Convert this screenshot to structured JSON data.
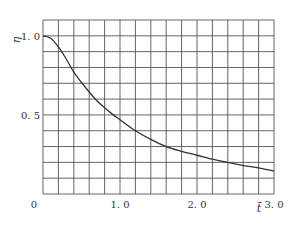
{
  "chart_data": {
    "type": "line",
    "title": "",
    "xlabel": "t̄",
    "ylabel": "η",
    "xlim": [
      0,
      3.0
    ],
    "ylim": [
      0,
      1.1
    ],
    "grid": true,
    "grid_x_step": 0.2,
    "grid_y_step": 0.1,
    "x_ticks": [
      {
        "value": 0,
        "label": "0"
      },
      {
        "value": 1.0,
        "label": "1. 0"
      },
      {
        "value": 2.0,
        "label": "2. 0"
      },
      {
        "value": 3.0,
        "label": "3. 0"
      }
    ],
    "y_ticks": [
      {
        "value": 0.5,
        "label": "0. 5"
      },
      {
        "value": 1.0,
        "label": "1. 0"
      }
    ],
    "legend": null,
    "series": [
      {
        "name": "η(t̄)",
        "color": "#333333",
        "x": [
          0,
          0.1,
          0.2,
          0.3,
          0.4,
          0.5,
          0.6,
          0.7,
          0.8,
          0.9,
          1.0,
          1.2,
          1.4,
          1.6,
          1.8,
          2.0,
          2.2,
          2.4,
          2.6,
          2.8,
          3.0
        ],
        "y": [
          1.0,
          0.985,
          0.93,
          0.855,
          0.77,
          0.705,
          0.645,
          0.59,
          0.545,
          0.505,
          0.47,
          0.4,
          0.345,
          0.3,
          0.27,
          0.245,
          0.22,
          0.2,
          0.18,
          0.165,
          0.145
        ]
      }
    ]
  }
}
